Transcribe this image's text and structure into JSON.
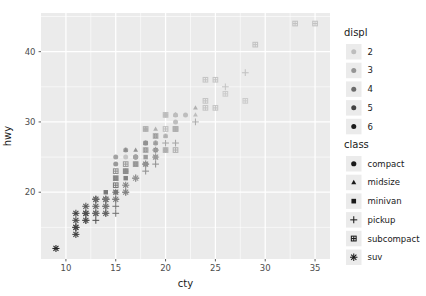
{
  "chart_data": {
    "type": "scatter",
    "title": "",
    "xlabel": "cty",
    "ylabel": "hwy",
    "xlim": [
      7.5,
      36.5
    ],
    "ylim": [
      10.5,
      45.5
    ],
    "xticks": [
      10,
      15,
      20,
      25,
      30,
      35
    ],
    "yticks": [
      20,
      30,
      40
    ],
    "grid": true,
    "panel_background": "#ebebeb",
    "grid_color": "#ffffff",
    "legend_position": "right",
    "shape_legend": {
      "title": "class",
      "entries": [
        {
          "label": "compact",
          "shape": "circle"
        },
        {
          "label": "midsize",
          "shape": "triangle"
        },
        {
          "label": "minivan",
          "shape": "square"
        },
        {
          "label": "pickup",
          "shape": "plus"
        },
        {
          "label": "subcompact",
          "shape": "square-plus"
        },
        {
          "label": "suv",
          "shape": "asterisk"
        }
      ]
    },
    "color_legend": {
      "title": "displ",
      "entries": [
        {
          "label": "2",
          "color": "#bdbdbd"
        },
        {
          "label": "3",
          "color": "#949494"
        },
        {
          "label": "4",
          "color": "#6b6b6b"
        },
        {
          "label": "5",
          "color": "#424242"
        },
        {
          "label": "6",
          "color": "#1a1a1a"
        }
      ]
    },
    "points": [
      {
        "cty": 18,
        "hwy": 29,
        "class": "compact",
        "displ": 1.8
      },
      {
        "cty": 21,
        "hwy": 29,
        "class": "compact",
        "displ": 1.8
      },
      {
        "cty": 20,
        "hwy": 31,
        "class": "compact",
        "displ": 2.0
      },
      {
        "cty": 21,
        "hwy": 30,
        "class": "compact",
        "displ": 2.0
      },
      {
        "cty": 16,
        "hwy": 26,
        "class": "compact",
        "displ": 2.8
      },
      {
        "cty": 18,
        "hwy": 26,
        "class": "compact",
        "displ": 2.8
      },
      {
        "cty": 18,
        "hwy": 27,
        "class": "compact",
        "displ": 3.1
      },
      {
        "cty": 18,
        "hwy": 26,
        "class": "compact",
        "displ": 1.8
      },
      {
        "cty": 16,
        "hwy": 25,
        "class": "compact",
        "displ": 1.8
      },
      {
        "cty": 20,
        "hwy": 28,
        "class": "compact",
        "displ": 2.0
      },
      {
        "cty": 19,
        "hwy": 27,
        "class": "compact",
        "displ": 2.0
      },
      {
        "cty": 15,
        "hwy": 25,
        "class": "compact",
        "displ": 2.8
      },
      {
        "cty": 17,
        "hwy": 25,
        "class": "compact",
        "displ": 2.8
      },
      {
        "cty": 17,
        "hwy": 25,
        "class": "compact",
        "displ": 3.1
      },
      {
        "cty": 15,
        "hwy": 24,
        "class": "compact",
        "displ": 3.1
      },
      {
        "cty": 17,
        "hwy": 25,
        "class": "compact",
        "displ": 2.8
      },
      {
        "cty": 16,
        "hwy": 23,
        "class": "compact",
        "displ": 3.1
      },
      {
        "cty": 18,
        "hwy": 26,
        "class": "compact",
        "displ": 2.4
      },
      {
        "cty": 21,
        "hwy": 29,
        "class": "compact",
        "displ": 2.4
      },
      {
        "cty": 21,
        "hwy": 31,
        "class": "compact",
        "displ": 2.0
      },
      {
        "cty": 22,
        "hwy": 31,
        "class": "compact",
        "displ": 2.0
      },
      {
        "cty": 19,
        "hwy": 27,
        "class": "compact",
        "displ": 2.5
      },
      {
        "cty": 20,
        "hwy": 26,
        "class": "compact",
        "displ": 2.5
      },
      {
        "cty": 18,
        "hwy": 26,
        "class": "midsize",
        "displ": 2.4
      },
      {
        "cty": 19,
        "hwy": 28,
        "class": "midsize",
        "displ": 2.4
      },
      {
        "cty": 18,
        "hwy": 27,
        "class": "midsize",
        "displ": 3.0
      },
      {
        "cty": 19,
        "hwy": 29,
        "class": "midsize",
        "displ": 2.4
      },
      {
        "cty": 21,
        "hwy": 31,
        "class": "midsize",
        "displ": 2.4
      },
      {
        "cty": 18,
        "hwy": 26,
        "class": "midsize",
        "displ": 3.0
      },
      {
        "cty": 19,
        "hwy": 28,
        "class": "midsize",
        "displ": 2.4
      },
      {
        "cty": 17,
        "hwy": 26,
        "class": "midsize",
        "displ": 3.3
      },
      {
        "cty": 16,
        "hwy": 26,
        "class": "midsize",
        "displ": 3.5
      },
      {
        "cty": 18,
        "hwy": 29,
        "class": "midsize",
        "displ": 2.4
      },
      {
        "cty": 20,
        "hwy": 28,
        "class": "midsize",
        "displ": 2.4
      },
      {
        "cty": 21,
        "hwy": 31,
        "class": "midsize",
        "displ": 2.0
      },
      {
        "cty": 23,
        "hwy": 31,
        "class": "midsize",
        "displ": 2.0
      },
      {
        "cty": 19,
        "hwy": 28,
        "class": "midsize",
        "displ": 3.0
      },
      {
        "cty": 23,
        "hwy": 32,
        "class": "midsize",
        "displ": 2.4
      },
      {
        "cty": 18,
        "hwy": 27,
        "class": "midsize",
        "displ": 3.5
      },
      {
        "cty": 19,
        "hwy": 27,
        "class": "midsize",
        "displ": 3.0
      },
      {
        "cty": 17,
        "hwy": 24,
        "class": "minivan",
        "displ": 3.3
      },
      {
        "cty": 17,
        "hwy": 24,
        "class": "minivan",
        "displ": 3.3
      },
      {
        "cty": 16,
        "hwy": 22,
        "class": "minivan",
        "displ": 3.8
      },
      {
        "cty": 15,
        "hwy": 22,
        "class": "minivan",
        "displ": 3.8
      },
      {
        "cty": 16,
        "hwy": 23,
        "class": "minivan",
        "displ": 3.3
      },
      {
        "cty": 15,
        "hwy": 20,
        "class": "minivan",
        "displ": 4.0
      },
      {
        "cty": 17,
        "hwy": 24,
        "class": "minivan",
        "displ": 3.3
      },
      {
        "cty": 18,
        "hwy": 25,
        "class": "minivan",
        "displ": 3.0
      },
      {
        "cty": 19,
        "hwy": 25,
        "class": "minivan",
        "displ": 3.0
      },
      {
        "cty": 18,
        "hwy": 26,
        "class": "minivan",
        "displ": 3.3
      },
      {
        "cty": 18,
        "hwy": 27,
        "class": "minivan",
        "displ": 3.3
      },
      {
        "cty": 19,
        "hwy": 26,
        "class": "minivan",
        "displ": 3.3
      },
      {
        "cty": 19,
        "hwy": 28,
        "class": "minivan",
        "displ": 3.3
      },
      {
        "cty": 18,
        "hwy": 24,
        "class": "minivan",
        "displ": 3.8
      },
      {
        "cty": 14,
        "hwy": 20,
        "class": "minivan",
        "displ": 4.0
      },
      {
        "cty": 13,
        "hwy": 19,
        "class": "pickup",
        "displ": 4.0
      },
      {
        "cty": 14,
        "hwy": 17,
        "class": "pickup",
        "displ": 4.7
      },
      {
        "cty": 14,
        "hwy": 19,
        "class": "pickup",
        "displ": 4.7
      },
      {
        "cty": 12,
        "hwy": 16,
        "class": "pickup",
        "displ": 5.2
      },
      {
        "cty": 13,
        "hwy": 16,
        "class": "pickup",
        "displ": 5.2
      },
      {
        "cty": 15,
        "hwy": 17,
        "class": "pickup",
        "displ": 4.2
      },
      {
        "cty": 14,
        "hwy": 18,
        "class": "pickup",
        "displ": 4.7
      },
      {
        "cty": 15,
        "hwy": 18,
        "class": "pickup",
        "displ": 4.2
      },
      {
        "cty": 16,
        "hwy": 20,
        "class": "pickup",
        "displ": 3.7
      },
      {
        "cty": 17,
        "hwy": 22,
        "class": "pickup",
        "displ": 3.7
      },
      {
        "cty": 15,
        "hwy": 19,
        "class": "pickup",
        "displ": 4.0
      },
      {
        "cty": 18,
        "hwy": 23,
        "class": "pickup",
        "displ": 3.3
      },
      {
        "cty": 19,
        "hwy": 24,
        "class": "pickup",
        "displ": 3.3
      },
      {
        "cty": 18,
        "hwy": 24,
        "class": "pickup",
        "displ": 3.3
      },
      {
        "cty": 19,
        "hwy": 26,
        "class": "pickup",
        "displ": 3.0
      },
      {
        "cty": 20,
        "hwy": 27,
        "class": "pickup",
        "displ": 2.7
      },
      {
        "cty": 21,
        "hwy": 27,
        "class": "pickup",
        "displ": 2.7
      },
      {
        "cty": 23,
        "hwy": 30,
        "class": "pickup",
        "displ": 2.5
      },
      {
        "cty": 28,
        "hwy": 37,
        "class": "pickup",
        "displ": 1.9
      },
      {
        "cty": 26,
        "hwy": 35,
        "class": "pickup",
        "displ": 1.8
      },
      {
        "cty": 20,
        "hwy": 31,
        "class": "subcompact",
        "displ": 2.0
      },
      {
        "cty": 18,
        "hwy": 29,
        "class": "subcompact",
        "displ": 2.5
      },
      {
        "cty": 18,
        "hwy": 26,
        "class": "subcompact",
        "displ": 2.5
      },
      {
        "cty": 16,
        "hwy": 24,
        "class": "subcompact",
        "displ": 3.0
      },
      {
        "cty": 15,
        "hwy": 23,
        "class": "subcompact",
        "displ": 3.4
      },
      {
        "cty": 17,
        "hwy": 24,
        "class": "subcompact",
        "displ": 3.0
      },
      {
        "cty": 19,
        "hwy": 28,
        "class": "subcompact",
        "displ": 2.5
      },
      {
        "cty": 20,
        "hwy": 29,
        "class": "subcompact",
        "displ": 2.0
      },
      {
        "cty": 21,
        "hwy": 29,
        "class": "subcompact",
        "displ": 2.0
      },
      {
        "cty": 20,
        "hwy": 26,
        "class": "subcompact",
        "displ": 2.4
      },
      {
        "cty": 21,
        "hwy": 26,
        "class": "subcompact",
        "displ": 2.4
      },
      {
        "cty": 24,
        "hwy": 32,
        "class": "subcompact",
        "displ": 1.8
      },
      {
        "cty": 25,
        "hwy": 32,
        "class": "subcompact",
        "displ": 1.8
      },
      {
        "cty": 24,
        "hwy": 33,
        "class": "subcompact",
        "displ": 1.8
      },
      {
        "cty": 26,
        "hwy": 34,
        "class": "subcompact",
        "displ": 1.6
      },
      {
        "cty": 28,
        "hwy": 33,
        "class": "subcompact",
        "displ": 1.6
      },
      {
        "cty": 29,
        "hwy": 41,
        "class": "subcompact",
        "displ": 1.9
      },
      {
        "cty": 33,
        "hwy": 44,
        "class": "subcompact",
        "displ": 1.9
      },
      {
        "cty": 35,
        "hwy": 44,
        "class": "subcompact",
        "displ": 1.9
      },
      {
        "cty": 24,
        "hwy": 36,
        "class": "subcompact",
        "displ": 1.8
      },
      {
        "cty": 25,
        "hwy": 36,
        "class": "subcompact",
        "displ": 1.8
      },
      {
        "cty": 21,
        "hwy": 29,
        "class": "subcompact",
        "displ": 2.5
      },
      {
        "cty": 15,
        "hwy": 22,
        "class": "subcompact",
        "displ": 3.5
      },
      {
        "cty": 16,
        "hwy": 23,
        "class": "subcompact",
        "displ": 3.5
      },
      {
        "cty": 15,
        "hwy": 21,
        "class": "subcompact",
        "displ": 4.0
      },
      {
        "cty": 14,
        "hwy": 19,
        "class": "suv",
        "displ": 4.0
      },
      {
        "cty": 13,
        "hwy": 17,
        "class": "suv",
        "displ": 4.7
      },
      {
        "cty": 14,
        "hwy": 17,
        "class": "suv",
        "displ": 4.7
      },
      {
        "cty": 11,
        "hwy": 15,
        "class": "suv",
        "displ": 5.2
      },
      {
        "cty": 11,
        "hwy": 14,
        "class": "suv",
        "displ": 5.7
      },
      {
        "cty": 12,
        "hwy": 17,
        "class": "suv",
        "displ": 5.2
      },
      {
        "cty": 13,
        "hwy": 18,
        "class": "suv",
        "displ": 4.7
      },
      {
        "cty": 12,
        "hwy": 16,
        "class": "suv",
        "displ": 5.4
      },
      {
        "cty": 11,
        "hwy": 17,
        "class": "suv",
        "displ": 5.7
      },
      {
        "cty": 13,
        "hwy": 19,
        "class": "suv",
        "displ": 4.6
      },
      {
        "cty": 14,
        "hwy": 19,
        "class": "suv",
        "displ": 4.0
      },
      {
        "cty": 11,
        "hwy": 16,
        "class": "suv",
        "displ": 5.4
      },
      {
        "cty": 9,
        "hwy": 12,
        "class": "suv",
        "displ": 6.5
      },
      {
        "cty": 12,
        "hwy": 18,
        "class": "suv",
        "displ": 5.0
      },
      {
        "cty": 13,
        "hwy": 19,
        "class": "suv",
        "displ": 4.6
      },
      {
        "cty": 14,
        "hwy": 18,
        "class": "suv",
        "displ": 4.2
      },
      {
        "cty": 15,
        "hwy": 19,
        "class": "suv",
        "displ": 4.0
      },
      {
        "cty": 16,
        "hwy": 20,
        "class": "suv",
        "displ": 3.7
      },
      {
        "cty": 11,
        "hwy": 15,
        "class": "suv",
        "displ": 5.7
      },
      {
        "cty": 13,
        "hwy": 17,
        "class": "suv",
        "displ": 4.6
      },
      {
        "cty": 15,
        "hwy": 20,
        "class": "suv",
        "displ": 4.0
      },
      {
        "cty": 14,
        "hwy": 19,
        "class": "suv",
        "displ": 4.2
      },
      {
        "cty": 12,
        "hwy": 17,
        "class": "suv",
        "displ": 5.3
      },
      {
        "cty": 16,
        "hwy": 21,
        "class": "suv",
        "displ": 3.8
      },
      {
        "cty": 17,
        "hwy": 22,
        "class": "suv",
        "displ": 3.3
      },
      {
        "cty": 18,
        "hwy": 24,
        "class": "suv",
        "displ": 3.3
      },
      {
        "cty": 19,
        "hwy": 25,
        "class": "suv",
        "displ": 3.0
      }
    ]
  }
}
